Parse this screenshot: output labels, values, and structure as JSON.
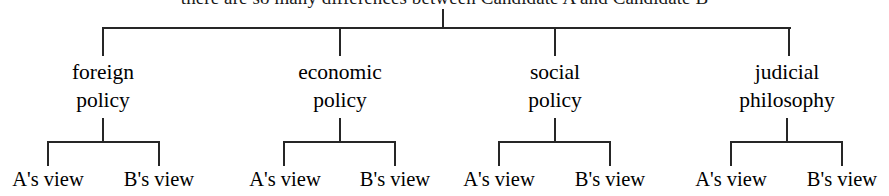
{
  "diagram": {
    "type": "tree-bracket-diagram",
    "title": "there are so many differences between Candidate A and Candidate B",
    "stroke_color": "#262626",
    "background_color": "#ffffff",
    "categories": [
      {
        "id": "foreign-policy",
        "line1": "foreign",
        "line2": "policy",
        "center_x": 103,
        "children": [
          {
            "id": "foreign-policy-a",
            "label": "A's view",
            "center_x": 48
          },
          {
            "id": "foreign-policy-b",
            "label": "B's view",
            "center_x": 159
          }
        ]
      },
      {
        "id": "economic-policy",
        "line1": "economic",
        "line2": "policy",
        "center_x": 340,
        "children": [
          {
            "id": "economic-policy-a",
            "label": "A's view",
            "center_x": 285
          },
          {
            "id": "economic-policy-b",
            "label": "B's view",
            "center_x": 395
          }
        ]
      },
      {
        "id": "social-policy",
        "line1": "social",
        "line2": "policy",
        "center_x": 555,
        "children": [
          {
            "id": "social-policy-a",
            "label": "A's view",
            "center_x": 499
          },
          {
            "id": "social-policy-b",
            "label": "B's view",
            "center_x": 610
          }
        ]
      },
      {
        "id": "judicial-philosophy",
        "line1": "judicial",
        "line2": "philosophy",
        "center_x": 787,
        "children": [
          {
            "id": "judicial-philosophy-a",
            "label": "A's view",
            "center_x": 731
          },
          {
            "id": "judicial-philosophy-b",
            "label": "B's view",
            "center_x": 842
          }
        ]
      }
    ]
  }
}
